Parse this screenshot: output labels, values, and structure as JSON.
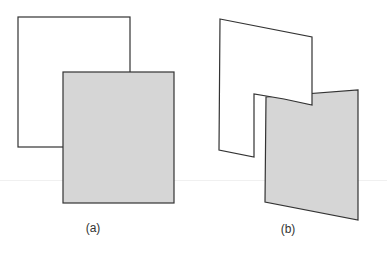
{
  "panels": [
    {
      "label": "(a)",
      "description": "Two overlapping rectangles; white rectangle behind, gray rectangle in front"
    },
    {
      "label": "(b)",
      "description": "White L-shaped notched polygon in front of gray parallelogram"
    }
  ],
  "colors": {
    "stroke": "#333333",
    "front_fill": "#d6d6d6",
    "back_fill": "#ffffff"
  }
}
